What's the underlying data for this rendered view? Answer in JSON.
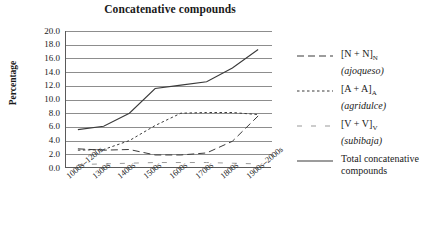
{
  "chart_data": {
    "type": "line",
    "title": "Concatenative compounds",
    "xlabel": "",
    "ylabel": "Percentage",
    "ylim": [
      0.0,
      20.0
    ],
    "ytick_step": 2.0,
    "grid": true,
    "legend_position": "right",
    "categories": [
      "1000s–1200s",
      "1300s",
      "1400s",
      "1500s",
      "1600s",
      "1700s",
      "1800s",
      "1900s–2000s"
    ],
    "yticks": [
      "20.0",
      "18.0",
      "16.0",
      "14.0",
      "12.0",
      "10.0",
      "8.0",
      "6.0",
      "4.0",
      "2.0",
      "0.0"
    ],
    "series": [
      {
        "name": "[N + N]N (ajoqueso)",
        "label_main": "[N + N]",
        "label_sub": "N",
        "label_example": "(ajoqueso)",
        "style": "long-dash",
        "values": [
          2.8,
          2.6,
          2.7,
          1.9,
          1.9,
          2.2,
          3.9,
          7.6
        ]
      },
      {
        "name": "[A + A]A (agridulce)",
        "label_main": "[A + A]",
        "label_sub": "A",
        "label_example": "(agridulce)",
        "style": "short-dash",
        "values": [
          2.6,
          2.7,
          4.0,
          6.2,
          8.0,
          8.1,
          8.1,
          7.8
        ]
      },
      {
        "name": "[V + V]V (subibaja)",
        "label_main": "[V + V]",
        "label_sub": "V",
        "label_example": "(subibaja)",
        "style": "sparse-dash",
        "values": [
          0.5,
          0.6,
          0.7,
          0.8,
          0.8,
          0.8,
          0.7,
          0.6
        ]
      },
      {
        "name": "Total concatenative compounds",
        "label_main": "Total concatenative compounds",
        "label_sub": "",
        "label_example": "",
        "style": "solid",
        "values": [
          5.6,
          6.1,
          8.0,
          11.6,
          12.1,
          12.6,
          14.6,
          17.3
        ]
      }
    ]
  },
  "colors": {
    "axis": "#5a5a5a",
    "grid": "#8d8d8d",
    "line": "#3a3a3a",
    "text": "#1a1a1a"
  }
}
